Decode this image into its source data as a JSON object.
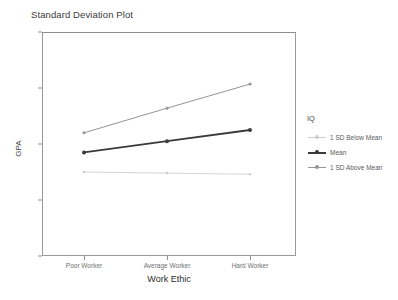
{
  "chart_data": {
    "type": "line",
    "title": "Standard Deviation Plot",
    "xlabel": "Work Ethic",
    "ylabel": "GPA",
    "categories": [
      "Poor Worker",
      "Average Worker",
      "Hard Worker"
    ],
    "ylim": [
      0,
      4
    ],
    "yticks": [
      0,
      1,
      2,
      3,
      4
    ],
    "ytick_labels": [
      "0",
      "1",
      "2",
      "3",
      "4"
    ],
    "grid": false,
    "legend_position": "right",
    "legend_title": "IQ",
    "markers": "filled-circle",
    "series": [
      {
        "name": "1 SD Below Mean",
        "values": [
          1.5,
          1.48,
          1.46
        ],
        "color": "#cfcfcf"
      },
      {
        "name": "Mean",
        "values": [
          1.85,
          2.05,
          2.25
        ],
        "color": "#3a3a3a"
      },
      {
        "name": "1 SD Above Mean",
        "values": [
          2.2,
          2.64,
          3.07
        ],
        "color": "#949494"
      }
    ]
  }
}
